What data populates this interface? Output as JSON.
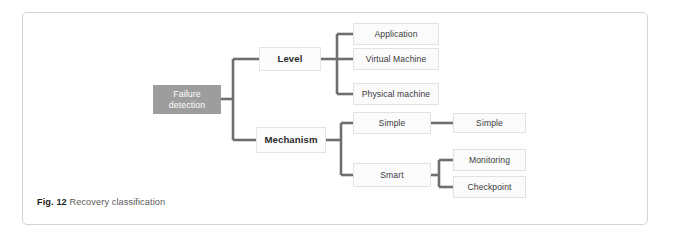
{
  "figure": {
    "caption_label": "Fig. 12",
    "caption_text": "Recovery classification"
  },
  "colors": {
    "root_fill": "#9d9d9d",
    "root_text": "#ffffff",
    "node_fill": "#fbfbfb",
    "node_border": "#e2e2e2",
    "connector": "#6e6e6e",
    "card_border": "#d4d4d4",
    "page_background": "#ffffff"
  },
  "diagram": {
    "type": "tree",
    "root": {
      "id": "failure-detection",
      "label": "Failure detection"
    },
    "branches": [
      {
        "id": "level",
        "label": "Level",
        "children": [
          {
            "id": "application",
            "label": "Application"
          },
          {
            "id": "virtual-machine",
            "label": "Virtual Machine"
          },
          {
            "id": "physical-machine",
            "label": "Physical machine"
          }
        ]
      },
      {
        "id": "mechanism",
        "label": "Mechanism",
        "children": [
          {
            "id": "simple",
            "label": "Simple",
            "children": [
              {
                "id": "simple-leaf",
                "label": "Simple"
              }
            ]
          },
          {
            "id": "smart",
            "label": "Smart",
            "children": [
              {
                "id": "monitoring",
                "label": "Monitoring"
              },
              {
                "id": "checkpoint",
                "label": "Checkpoint"
              }
            ]
          }
        ]
      }
    ]
  }
}
